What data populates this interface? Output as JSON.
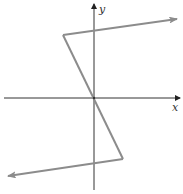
{
  "diagram": {
    "type": "piecewise-linear-graph",
    "axes": {
      "x_label": "x",
      "y_label": "y",
      "axis_color": "#333333"
    },
    "curve": {
      "color": "#8c8c8c",
      "description": "Piecewise linear function: rises to the right above a local maximum, falls steeply through the origin, then continues left below a local minimum",
      "segments": [
        {
          "name": "upper-ray",
          "from": "top-left corner",
          "to": "upper-right arrow"
        },
        {
          "name": "middle-segment",
          "from": "top-left corner",
          "to": "bottom-right corner",
          "passes_through": "origin"
        },
        {
          "name": "lower-ray",
          "from": "bottom-right corner",
          "to": "lower-left arrow"
        }
      ]
    }
  }
}
